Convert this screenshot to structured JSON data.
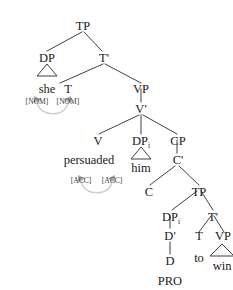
{
  "figure": {
    "type": "syntax-tree",
    "sentence": "she persuaded him to win",
    "colors": {
      "text": "#1a1a1a",
      "branch": "#2a2a2a",
      "feature_text": "#3a3a3a",
      "agree_curve": "#cfcfcf",
      "agree_arrowhead": "#a8a8a8",
      "background": "#ffffff"
    }
  },
  "nodes": {
    "tp_root": "TP",
    "dp_subject": "DP",
    "t_bar_1": "T'",
    "she": "she",
    "t_1": "T",
    "vp_1": "VP",
    "v_bar": "V'",
    "v": "V",
    "dp_object": "DP",
    "dp_object_sub": "i",
    "cp": "CP",
    "persuaded": "persuaded",
    "him": "him",
    "c_bar": "C'",
    "c": "C",
    "tp_embedded": "TP",
    "dp_pro": "DP",
    "dp_pro_sub": "i",
    "t_bar_2": "T'",
    "d_bar": "D'",
    "t_2": "T",
    "vp_2": "VP",
    "d": "D",
    "to": "to",
    "win": "win",
    "pro": "PRO"
  },
  "features": {
    "nom_probe": "[NOM]",
    "nom_goal": "[NOM]",
    "acc_probe": "[ACC]",
    "acc_goal": "[ACC]"
  },
  "agree_relations": [
    {
      "name": "nominative-agree",
      "probe": "[NOM]",
      "goal": "[NOM]",
      "case": "NOM"
    },
    {
      "name": "accusative-agree",
      "probe": "[ACC]",
      "goal": "[ACC]",
      "case": "ACC"
    }
  ]
}
